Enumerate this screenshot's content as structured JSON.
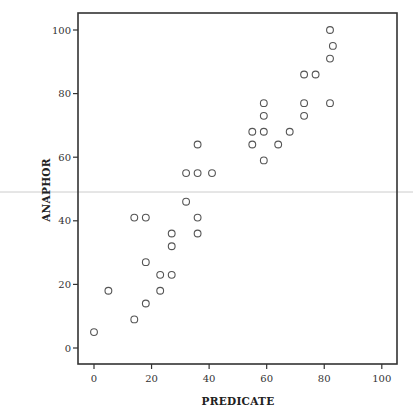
{
  "chart_data": {
    "type": "scatter",
    "title": "",
    "xlabel": "PREDICATE",
    "ylabel": "ANAPHOR",
    "xlim": [
      -5,
      105
    ],
    "ylim": [
      -5,
      105
    ],
    "xticks": [
      0,
      20,
      40,
      60,
      80,
      100
    ],
    "yticks": [
      0,
      20,
      40,
      60,
      80,
      100
    ],
    "xtick_labels": [
      "0",
      "20",
      "40",
      "60",
      "80",
      "100"
    ],
    "ytick_labels": [
      "0",
      "20",
      "40",
      "60",
      "80",
      "100"
    ],
    "grid": false,
    "legend": null,
    "marker": "open-circle",
    "colors": {
      "marker": "#555555",
      "axis": "#333333",
      "artifact_line": "#cccccc"
    },
    "points": [
      {
        "x": 0,
        "y": 5
      },
      {
        "x": 5,
        "y": 18
      },
      {
        "x": 14,
        "y": 9
      },
      {
        "x": 18,
        "y": 14
      },
      {
        "x": 14,
        "y": 41
      },
      {
        "x": 18,
        "y": 41
      },
      {
        "x": 18,
        "y": 27
      },
      {
        "x": 23,
        "y": 23
      },
      {
        "x": 23,
        "y": 18
      },
      {
        "x": 27,
        "y": 23
      },
      {
        "x": 27,
        "y": 32
      },
      {
        "x": 27,
        "y": 36
      },
      {
        "x": 32,
        "y": 46
      },
      {
        "x": 32,
        "y": 55
      },
      {
        "x": 36,
        "y": 55
      },
      {
        "x": 41,
        "y": 55
      },
      {
        "x": 36,
        "y": 64
      },
      {
        "x": 36,
        "y": 41
      },
      {
        "x": 36,
        "y": 36
      },
      {
        "x": 55,
        "y": 68
      },
      {
        "x": 59,
        "y": 68
      },
      {
        "x": 68,
        "y": 68
      },
      {
        "x": 55,
        "y": 64
      },
      {
        "x": 64,
        "y": 64
      },
      {
        "x": 59,
        "y": 59
      },
      {
        "x": 59,
        "y": 73
      },
      {
        "x": 73,
        "y": 73
      },
      {
        "x": 59,
        "y": 77
      },
      {
        "x": 73,
        "y": 77
      },
      {
        "x": 82,
        "y": 77
      },
      {
        "x": 73,
        "y": 86
      },
      {
        "x": 77,
        "y": 86
      },
      {
        "x": 82,
        "y": 91
      },
      {
        "x": 83,
        "y": 95
      },
      {
        "x": 82,
        "y": 100
      }
    ]
  }
}
